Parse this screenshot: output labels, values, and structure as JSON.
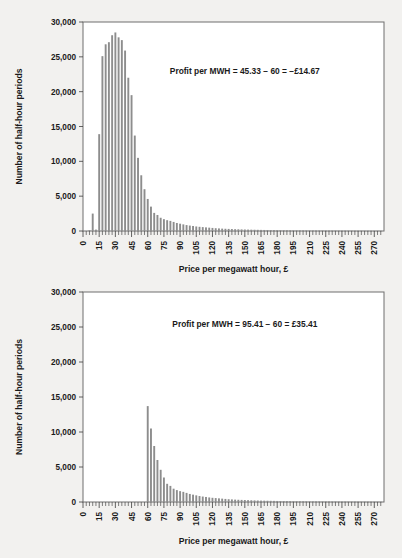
{
  "figure": {
    "background_color": "#f2f1ef",
    "bar_color": "#8d8d8d",
    "frame_color": "#6e6e6e"
  },
  "chart_data": [
    {
      "id": "top",
      "type": "bar",
      "title": "",
      "xlabel": "Price per megawatt hour, £",
      "ylabel": "Number of half-hour periods",
      "annotation": "Profit per MWH = 45.33 − 60 = −£14.67",
      "annotation_x": 150,
      "annotation_y": 22500,
      "xlim": [
        0,
        279
      ],
      "ylim": [
        0,
        30000
      ],
      "ytick_values": [
        0,
        5000,
        10000,
        15000,
        20000,
        25000,
        30000
      ],
      "ytick_labels": [
        "0",
        "5,000",
        "10,000",
        "15,000",
        "20,000",
        "25,000",
        "30,000"
      ],
      "xtick_values": [
        0,
        15,
        30,
        45,
        60,
        75,
        90,
        105,
        120,
        135,
        150,
        165,
        180,
        195,
        210,
        225,
        240,
        255,
        270
      ],
      "xtick_labels": [
        "0",
        "15",
        "30",
        "45",
        "60",
        "75",
        "90",
        "105",
        "120",
        "135",
        "150",
        "165",
        "180",
        "195",
        "210",
        "225",
        "240",
        "255",
        "270"
      ],
      "minor_tick_step": 3,
      "bin_width": 3,
      "grid": false,
      "legend": "none",
      "x": [
        0,
        3,
        6,
        9,
        12,
        15,
        18,
        21,
        24,
        27,
        30,
        33,
        36,
        39,
        42,
        45,
        48,
        51,
        54,
        57,
        60,
        63,
        66,
        69,
        72,
        75,
        78,
        81,
        84,
        87,
        90,
        93,
        96,
        99,
        102,
        105,
        108,
        111,
        114,
        117,
        120,
        123,
        126,
        129,
        132,
        135,
        138,
        141,
        144,
        147,
        150,
        153,
        156,
        159,
        162,
        165,
        168,
        171,
        174,
        177,
        180,
        183,
        186,
        189,
        192,
        195,
        198,
        201,
        204,
        207,
        210,
        213,
        216,
        219,
        222,
        225,
        228,
        231,
        234,
        237,
        240,
        243,
        246,
        249,
        252,
        255,
        258,
        261,
        264,
        267,
        270,
        273,
        276
      ],
      "values": [
        0,
        0,
        120,
        2500,
        200,
        13900,
        25100,
        26800,
        27100,
        28100,
        28500,
        27800,
        27400,
        25900,
        22000,
        19500,
        13700,
        10500,
        8000,
        6000,
        4600,
        3500,
        2600,
        2300,
        1900,
        1700,
        1550,
        1450,
        1300,
        1150,
        1050,
        950,
        850,
        780,
        720,
        650,
        600,
        560,
        520,
        480,
        440,
        400,
        370,
        340,
        320,
        300,
        280,
        260,
        245,
        230,
        215,
        200,
        190,
        180,
        170,
        160,
        150,
        145,
        140,
        135,
        130,
        125,
        120,
        115,
        110,
        105,
        100,
        98,
        95,
        92,
        90,
        88,
        85,
        82,
        80,
        78,
        75,
        72,
        70,
        68,
        66,
        64,
        62,
        60,
        58,
        56,
        54,
        52,
        50,
        48,
        46,
        44,
        42
      ]
    },
    {
      "id": "bottom",
      "type": "bar",
      "title": "",
      "xlabel": "Price per megawatt hour, £",
      "ylabel": "Number of half-hour periods",
      "annotation": "Profit per MWH = 95.41 − 60 = £35.41",
      "annotation_x": 150,
      "annotation_y": 25000,
      "xlim": [
        0,
        279
      ],
      "ylim": [
        0,
        30000
      ],
      "ytick_values": [
        0,
        5000,
        10000,
        15000,
        20000,
        25000,
        30000
      ],
      "ytick_labels": [
        "0",
        "5,000",
        "10,000",
        "15,000",
        "20,000",
        "25,000",
        "30,000"
      ],
      "xtick_values": [
        0,
        15,
        30,
        45,
        60,
        75,
        90,
        105,
        120,
        135,
        150,
        165,
        180,
        195,
        210,
        225,
        240,
        255,
        270
      ],
      "xtick_labels": [
        "0",
        "15",
        "30",
        "45",
        "60",
        "75",
        "90",
        "105",
        "120",
        "135",
        "150",
        "165",
        "180",
        "195",
        "210",
        "225",
        "240",
        "255",
        "270"
      ],
      "minor_tick_step": 3,
      "bin_width": 3,
      "grid": false,
      "legend": "none",
      "x": [
        0,
        3,
        6,
        9,
        12,
        15,
        18,
        21,
        24,
        27,
        30,
        33,
        36,
        39,
        42,
        45,
        48,
        51,
        54,
        57,
        60,
        63,
        66,
        69,
        72,
        75,
        78,
        81,
        84,
        87,
        90,
        93,
        96,
        99,
        102,
        105,
        108,
        111,
        114,
        117,
        120,
        123,
        126,
        129,
        132,
        135,
        138,
        141,
        144,
        147,
        150,
        153,
        156,
        159,
        162,
        165,
        168,
        171,
        174,
        177,
        180,
        183,
        186,
        189,
        192,
        195,
        198,
        201,
        204,
        207,
        210,
        213,
        216,
        219,
        222,
        225,
        228,
        231,
        234,
        237,
        240,
        243,
        246,
        249,
        252,
        255,
        258,
        261,
        264,
        267,
        270,
        273,
        276
      ],
      "values": [
        0,
        0,
        0,
        0,
        0,
        0,
        0,
        0,
        0,
        0,
        0,
        0,
        0,
        0,
        0,
        0,
        0,
        0,
        0,
        0,
        13700,
        10500,
        8000,
        6000,
        4600,
        3500,
        2600,
        2300,
        1900,
        1700,
        1550,
        1450,
        1300,
        1150,
        1050,
        950,
        850,
        780,
        720,
        650,
        600,
        560,
        520,
        480,
        440,
        400,
        370,
        340,
        320,
        300,
        280,
        260,
        245,
        230,
        215,
        200,
        190,
        180,
        170,
        160,
        150,
        145,
        140,
        135,
        130,
        125,
        120,
        115,
        110,
        105,
        100,
        98,
        95,
        92,
        90,
        88,
        85,
        82,
        80,
        78,
        75,
        72,
        70,
        68,
        66,
        64,
        62,
        60,
        58,
        56,
        54,
        52,
        50
      ]
    }
  ]
}
